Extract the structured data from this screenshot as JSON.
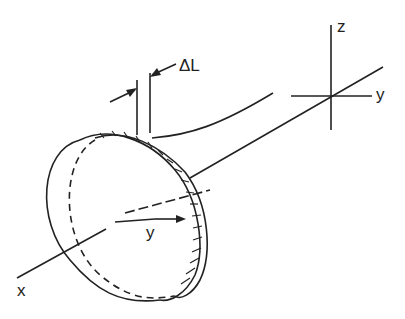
{
  "diagram": {
    "type": "technical-line-drawing",
    "labels": {
      "delta_l": "ΔL",
      "z_axis": "z",
      "y_axis": "y",
      "radius_y": "y",
      "x_axis": "x"
    },
    "colors": {
      "line": "#222222",
      "background": "#ffffff"
    }
  }
}
